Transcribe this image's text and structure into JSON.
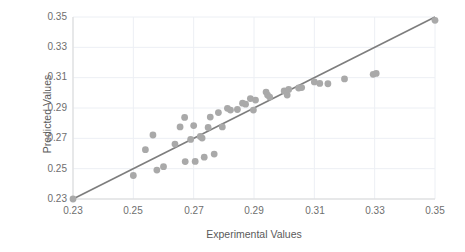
{
  "chart_data": {
    "type": "scatter",
    "title": "",
    "xlabel": "Experimental Values",
    "ylabel": "Predicted Values",
    "xlim": [
      0.23,
      0.35
    ],
    "ylim": [
      0.23,
      0.35
    ],
    "xticks": [
      "0.23",
      "0.25",
      "0.27",
      "0.29",
      "0.31",
      "0.33",
      "0.35"
    ],
    "yticks": [
      "0.23",
      "0.25",
      "0.27",
      "0.29",
      "0.31",
      "0.33",
      "0.35"
    ],
    "grid": true,
    "legend": "none",
    "marker_color": "#a9a9a9",
    "line_color": "#7d7d7d",
    "grid_color": "#eceff4",
    "axis_color": "#d9d9d9",
    "reference_line": {
      "name": "identity-line",
      "x": [
        0.23,
        0.35
      ],
      "y": [
        0.23,
        0.35
      ]
    },
    "points": [
      {
        "x": 0.23,
        "y": 0.23
      },
      {
        "x": 0.25,
        "y": 0.2455
      },
      {
        "x": 0.254,
        "y": 0.2625
      },
      {
        "x": 0.2565,
        "y": 0.2722
      },
      {
        "x": 0.2578,
        "y": 0.2491
      },
      {
        "x": 0.26,
        "y": 0.2513
      },
      {
        "x": 0.2638,
        "y": 0.2662
      },
      {
        "x": 0.2655,
        "y": 0.2775
      },
      {
        "x": 0.267,
        "y": 0.2838
      },
      {
        "x": 0.2672,
        "y": 0.2547
      },
      {
        "x": 0.269,
        "y": 0.2693
      },
      {
        "x": 0.27,
        "y": 0.2784
      },
      {
        "x": 0.2705,
        "y": 0.2548
      },
      {
        "x": 0.2722,
        "y": 0.2712
      },
      {
        "x": 0.2728,
        "y": 0.2702
      },
      {
        "x": 0.2735,
        "y": 0.2576
      },
      {
        "x": 0.2748,
        "y": 0.2772
      },
      {
        "x": 0.2755,
        "y": 0.284
      },
      {
        "x": 0.2768,
        "y": 0.2596
      },
      {
        "x": 0.2782,
        "y": 0.287
      },
      {
        "x": 0.2795,
        "y": 0.2775
      },
      {
        "x": 0.2812,
        "y": 0.2898
      },
      {
        "x": 0.2822,
        "y": 0.2886
      },
      {
        "x": 0.2845,
        "y": 0.289
      },
      {
        "x": 0.2862,
        "y": 0.2932
      },
      {
        "x": 0.2872,
        "y": 0.2925
      },
      {
        "x": 0.2888,
        "y": 0.2962
      },
      {
        "x": 0.2898,
        "y": 0.2886
      },
      {
        "x": 0.2905,
        "y": 0.2952
      },
      {
        "x": 0.294,
        "y": 0.3005
      },
      {
        "x": 0.2945,
        "y": 0.2985
      },
      {
        "x": 0.2952,
        "y": 0.2972
      },
      {
        "x": 0.3,
        "y": 0.3012
      },
      {
        "x": 0.301,
        "y": 0.2985
      },
      {
        "x": 0.3015,
        "y": 0.3022
      },
      {
        "x": 0.3048,
        "y": 0.3032
      },
      {
        "x": 0.3058,
        "y": 0.3035
      },
      {
        "x": 0.31,
        "y": 0.3072
      },
      {
        "x": 0.3118,
        "y": 0.3062
      },
      {
        "x": 0.3145,
        "y": 0.306
      },
      {
        "x": 0.32,
        "y": 0.3092
      },
      {
        "x": 0.3295,
        "y": 0.3122
      },
      {
        "x": 0.3305,
        "y": 0.3128
      },
      {
        "x": 0.35,
        "y": 0.3478
      }
    ]
  }
}
